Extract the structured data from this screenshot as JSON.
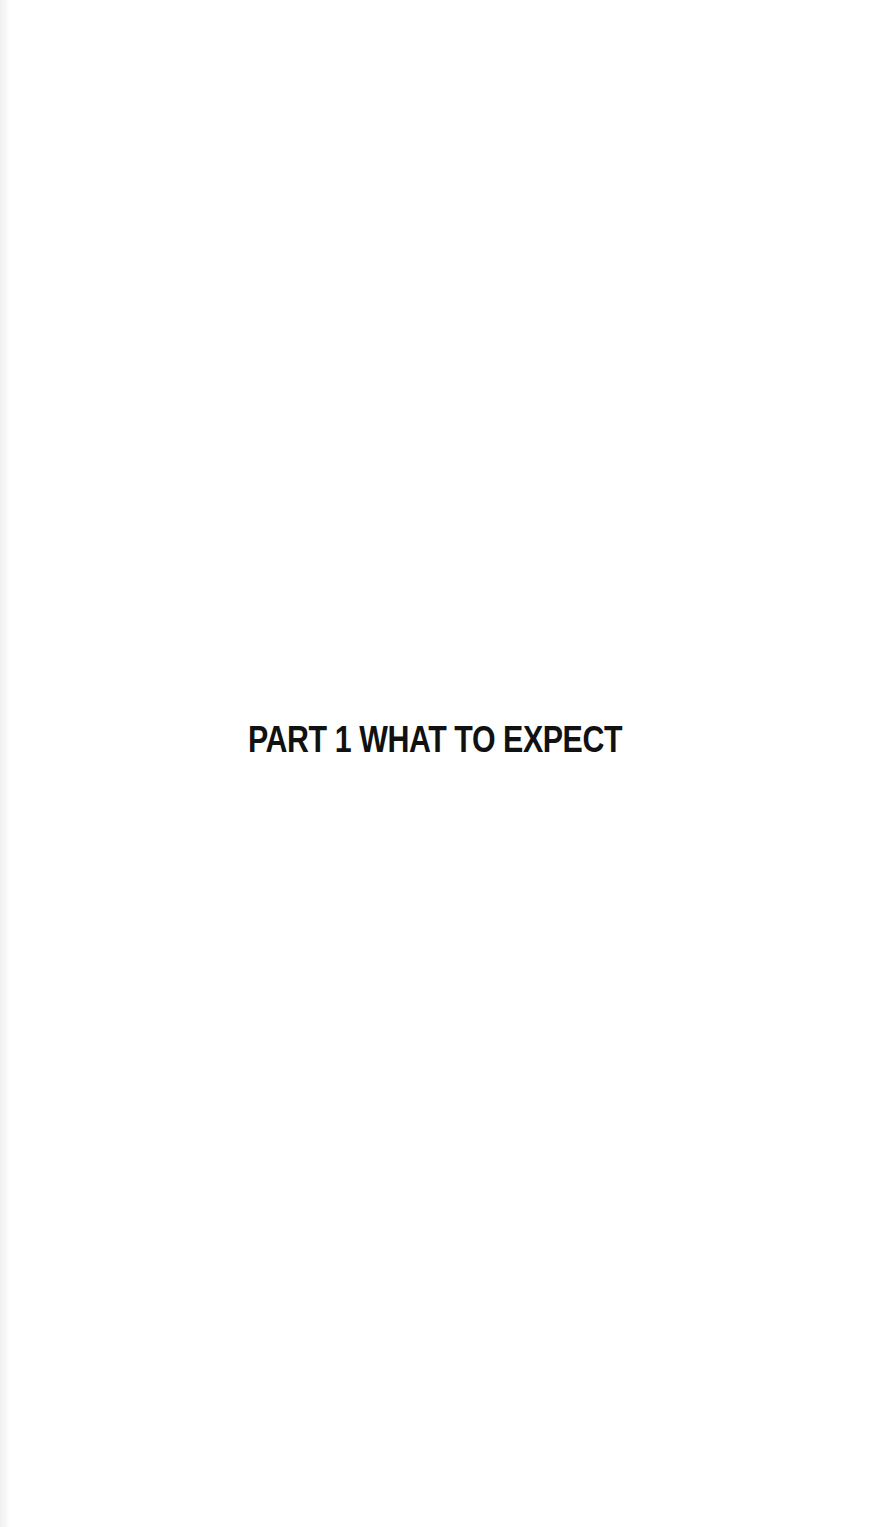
{
  "page": {
    "heading": "PART 1 WHAT TO EXPECT"
  },
  "colors": {
    "background": "#ffffff",
    "text": "#111111"
  }
}
